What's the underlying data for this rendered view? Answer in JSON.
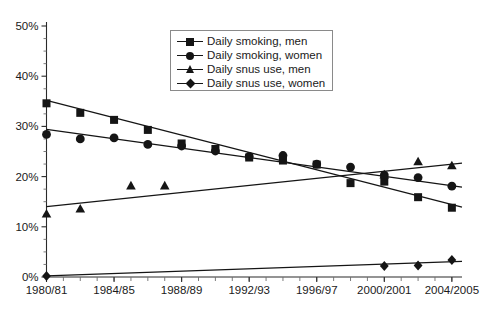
{
  "chart_data": {
    "type": "line",
    "title": "",
    "subtitle": "",
    "xlabel": "",
    "ylabel": "",
    "grid": false,
    "legend_position": "top-center",
    "ylim": [
      0,
      50
    ],
    "y_unit": "%",
    "y_ticks": [
      "0%",
      "10%",
      "20%",
      "30%",
      "40%",
      "50%"
    ],
    "y_tick_values": [
      0,
      10,
      20,
      30,
      40,
      50
    ],
    "y_minor_step": 2.5,
    "x_ticks": [
      "1980/81",
      "1984/85",
      "1988/89",
      "1992/93",
      "1996/97",
      "2000/2001",
      "2004/2005"
    ],
    "x_tick_values": [
      1980,
      1984,
      1988,
      1992,
      1996,
      2000,
      2004
    ],
    "xlim": [
      1980,
      2004.6
    ],
    "x_minor_step": 1,
    "series": [
      {
        "name": "Daily smoking, men",
        "marker": "square",
        "color": "#151515",
        "points": [
          {
            "x": 1980,
            "y": 34.6
          },
          {
            "x": 1982,
            "y": 32.7
          },
          {
            "x": 1984,
            "y": 31.3
          },
          {
            "x": 1986,
            "y": 29.3
          },
          {
            "x": 1988,
            "y": 26.6
          },
          {
            "x": 1990,
            "y": 25.5
          },
          {
            "x": 1992,
            "y": 23.8
          },
          {
            "x": 1994,
            "y": 23.2
          },
          {
            "x": 1996,
            "y": 22.4
          },
          {
            "x": 1998,
            "y": 18.7
          },
          {
            "x": 2000,
            "y": 19.0
          },
          {
            "x": 2002,
            "y": 15.9
          },
          {
            "x": 2004,
            "y": 13.8
          }
        ],
        "trend_start": {
          "x": 1980,
          "y": 35.2
        },
        "trend_end": {
          "x": 2004.6,
          "y": 13.9
        }
      },
      {
        "name": "Daily smoking, women",
        "marker": "circle",
        "color": "#151515",
        "points": [
          {
            "x": 1980,
            "y": 28.4
          },
          {
            "x": 1982,
            "y": 27.5
          },
          {
            "x": 1984,
            "y": 27.7
          },
          {
            "x": 1986,
            "y": 26.4
          },
          {
            "x": 1988,
            "y": 26.1
          },
          {
            "x": 1990,
            "y": 25.1
          },
          {
            "x": 1992,
            "y": 24.0
          },
          {
            "x": 1994,
            "y": 24.2
          },
          {
            "x": 1996,
            "y": 22.5
          },
          {
            "x": 1998,
            "y": 21.9
          },
          {
            "x": 2000,
            "y": 20.3
          },
          {
            "x": 2002,
            "y": 19.8
          },
          {
            "x": 2004,
            "y": 18.1
          }
        ],
        "trend_start": {
          "x": 1980,
          "y": 29.4
        },
        "trend_end": {
          "x": 2004.6,
          "y": 17.9
        }
      },
      {
        "name": "Daily snus use, men",
        "marker": "triangle",
        "color": "#151515",
        "points": [
          {
            "x": 1980,
            "y": 12.6
          },
          {
            "x": 1982,
            "y": 13.6
          },
          {
            "x": 1985,
            "y": 18.2
          },
          {
            "x": 1987,
            "y": 18.2
          },
          {
            "x": 2000,
            "y": 20.4
          },
          {
            "x": 2002,
            "y": 23.0
          },
          {
            "x": 2004,
            "y": 22.2
          }
        ],
        "trend_start": {
          "x": 1980,
          "y": 14.0
        },
        "trend_end": {
          "x": 2004.6,
          "y": 22.7
        }
      },
      {
        "name": "Daily snus use, women",
        "marker": "diamond",
        "color": "#151515",
        "points": [
          {
            "x": 1980,
            "y": 0.2
          },
          {
            "x": 2000,
            "y": 2.2
          },
          {
            "x": 2002,
            "y": 2.3
          },
          {
            "x": 2004,
            "y": 3.4
          }
        ],
        "trend_start": {
          "x": 1980,
          "y": 0.2
        },
        "trend_end": {
          "x": 2004.6,
          "y": 3.1
        }
      }
    ]
  },
  "legend": {
    "items": [
      {
        "label": "Daily smoking, men",
        "marker": "square"
      },
      {
        "label": "Daily smoking, women",
        "marker": "circle"
      },
      {
        "label": "Daily snus use, men",
        "marker": "triangle"
      },
      {
        "label": "Daily snus use, women",
        "marker": "diamond"
      }
    ]
  }
}
